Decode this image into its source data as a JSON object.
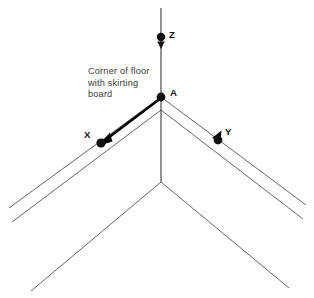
{
  "diagram": {
    "caption": {
      "text": "Corner of floor\nwith skirting\nboard",
      "line1": "Corner of floor",
      "line2": "with skirting",
      "line3": "board"
    },
    "labels": {
      "origin": "A",
      "axis_x": "X",
      "axis_y": "Y",
      "axis_z": "Z"
    },
    "colors": {
      "stroke_thin": "#555555",
      "stroke_axis": "#3a3a3a",
      "stroke_thick": "#000000",
      "marker": "#111111",
      "text": "#3b3b3b",
      "label": "#111111",
      "background": "#ffffff"
    },
    "points": {
      "A": {
        "x": 161,
        "y": 97
      },
      "X": {
        "x": 101,
        "y": 143
      },
      "Y": {
        "x": 218,
        "y": 140
      },
      "Z": {
        "x": 161,
        "y": 37
      },
      "inner_corner": {
        "x": 161,
        "y": 182
      }
    },
    "geometry": {
      "vertical_axis": {
        "x": 161,
        "y_top": 8,
        "y_bottom": 182
      },
      "wall_left_upper": {
        "x1": 161,
        "y1": 97,
        "x2": 9,
        "y2": 208
      },
      "wall_right_upper": {
        "x1": 161,
        "y1": 97,
        "x2": 306,
        "y2": 205
      },
      "wall_left_lower": {
        "x1": 161,
        "y1": 110,
        "x2": 12,
        "y2": 222
      },
      "wall_right_lower": {
        "x1": 161,
        "y1": 110,
        "x2": 303,
        "y2": 219
      },
      "floor_left": {
        "x1": 161,
        "y1": 182,
        "x2": 31,
        "y2": 291
      },
      "floor_right": {
        "x1": 161,
        "y1": 182,
        "x2": 289,
        "y2": 288
      }
    }
  }
}
